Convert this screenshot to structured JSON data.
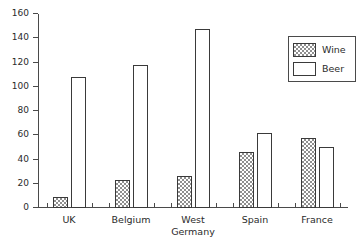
{
  "chart_data": {
    "type": "bar",
    "title": "",
    "subtitle": "",
    "xlabel": "",
    "ylabel": "",
    "categories": [
      "UK",
      "Belgium",
      "West\nGermany",
      "Spain",
      "France"
    ],
    "series": [
      {
        "name": "Wine",
        "values": [
          9,
          23,
          26,
          46,
          58
        ],
        "fill": "hatched",
        "color": "#8f8f8f"
      },
      {
        "name": "Beer",
        "values": [
          108,
          118,
          148,
          62,
          50
        ],
        "fill": "empty",
        "color": "#ffffff"
      }
    ],
    "ylim": [
      0,
      160
    ],
    "yticks": [
      0,
      20,
      40,
      60,
      80,
      100,
      120,
      140,
      160
    ],
    "ytick_labels": [
      "0",
      "20",
      "40",
      "60",
      "80",
      "100",
      "120",
      "140",
      "160"
    ],
    "grid": false,
    "legend": {
      "position": "top-right",
      "entries": [
        {
          "label": "Wine",
          "swatch": "hatched"
        },
        {
          "label": "Beer",
          "swatch": "empty"
        }
      ]
    },
    "axis_color": "#4a4a4a",
    "bar_outline_color": "#3a3a3a"
  }
}
